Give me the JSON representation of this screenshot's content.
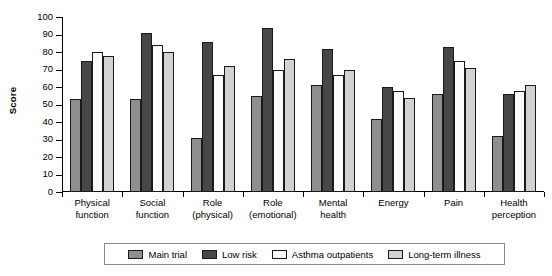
{
  "chart_data": {
    "type": "bar",
    "title": "",
    "xlabel": "",
    "ylabel": "Score",
    "ylim": [
      0,
      100
    ],
    "ytick_step": 10,
    "yticks": [
      100,
      90,
      80,
      70,
      60,
      50,
      40,
      30,
      20,
      10,
      0
    ],
    "grid": false,
    "legend_position": "bottom",
    "categories": [
      "Physical function",
      "Social function",
      "Role (physical)",
      "Role (emotional)",
      "Mental health",
      "Energy",
      "Pain",
      "Health perception"
    ],
    "category_lines": [
      [
        "Physical",
        "function"
      ],
      [
        "Social",
        "function"
      ],
      [
        "Role",
        "(physical)"
      ],
      [
        "Role",
        "(emotional)"
      ],
      [
        "Mental",
        "health"
      ],
      [
        "Energy",
        ""
      ],
      [
        "Pain",
        ""
      ],
      [
        "Health",
        "perception"
      ]
    ],
    "series": [
      {
        "name": "Main trial",
        "color": "#8f8f8f",
        "values": [
          53,
          53,
          31,
          55,
          61,
          42,
          56,
          32
        ]
      },
      {
        "name": "Low risk",
        "color": "#474747",
        "values": [
          75,
          91,
          86,
          94,
          82,
          60,
          83,
          56
        ]
      },
      {
        "name": "Asthma outpatients",
        "color": "#fbfbfb",
        "values": [
          80,
          84,
          67,
          70,
          67,
          58,
          75,
          58
        ]
      },
      {
        "name": "Long-term illness",
        "color": "#d2d2d2",
        "values": [
          78,
          80,
          72,
          76,
          70,
          54,
          71,
          61
        ]
      }
    ]
  }
}
